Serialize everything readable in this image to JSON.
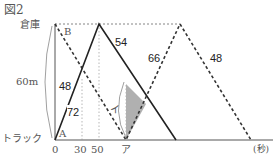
{
  "figure": {
    "title": "図2",
    "y_top_label": "倉庫",
    "y_bottom_label": "トラック",
    "distance_label": "60m",
    "x_unit_label": "(秒)",
    "x_ticks": [
      "0",
      "30",
      "50",
      "ア"
    ],
    "point_labels": {
      "A": "A",
      "B": "B"
    },
    "angle_label": "イ",
    "segment_labels": {
      "solid_up": "72",
      "solid_down": "54",
      "dashed_down_first": "48",
      "dashed_up": "66",
      "dashed_down_last": "48"
    }
  },
  "colors": {
    "solid_line": "#222222",
    "dashed_line": "#333333",
    "dotted_guide": "#888888",
    "axis": "#555555",
    "shade": "#b0b0b0"
  }
}
